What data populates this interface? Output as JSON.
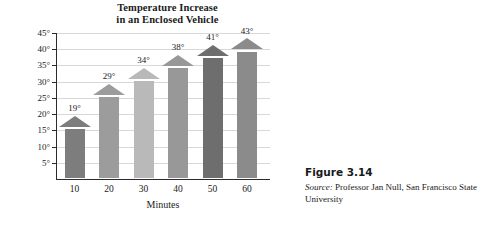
{
  "chart_data": {
    "type": "bar",
    "title": "Temperature Increase in an Enclosed Vehicle",
    "title_line1": "Temperature Increase",
    "title_line2": "in an Enclosed Vehicle",
    "xlabel": "Minutes",
    "ylabel": "Temperature Increase (°F)",
    "categories": [
      "10",
      "20",
      "30",
      "40",
      "50",
      "60"
    ],
    "values": [
      19,
      29,
      34,
      38,
      41,
      43
    ],
    "data_labels": [
      "19°",
      "29°",
      "34°",
      "38°",
      "41°",
      "43°"
    ],
    "bar_colors": [
      "#7d7d7d",
      "#9c9c9c",
      "#b9b9b9",
      "#989898",
      "#6e6e6e",
      "#8b8b8b"
    ],
    "ylim": [
      0,
      45
    ],
    "yticks": [
      5,
      10,
      15,
      20,
      25,
      30,
      35,
      40,
      45
    ],
    "ytick_labels": [
      "5°",
      "10°",
      "15°",
      "20°",
      "25°",
      "30°",
      "35°",
      "40°",
      "45°"
    ],
    "grid": true,
    "legend": "none"
  },
  "caption": {
    "figure_number": "Figure 3.14",
    "source_label": "Source:",
    "source_text": " Professor Jan Null, San Francisco State University"
  }
}
